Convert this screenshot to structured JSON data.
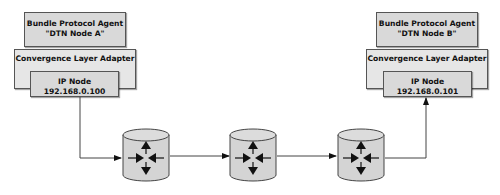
{
  "nodes": {
    "a": {
      "bpa": {
        "line1": "Bundle Protocol Agent",
        "line2": "\"DTN Node A\""
      },
      "cla": {
        "label": "Convergence Layer Adapter"
      },
      "ip": {
        "line1": "IP Node",
        "line2": "192.168.0.100"
      }
    },
    "b": {
      "bpa": {
        "line1": "Bundle Protocol Agent",
        "line2": "\"DTN Node B\""
      },
      "cla": {
        "label": "Convergence Layer Adapter"
      },
      "ip": {
        "line1": "IP Node",
        "line2": "192.168.0.101"
      }
    }
  },
  "routers": [
    {
      "icon": "router-icon"
    },
    {
      "icon": "router-icon"
    },
    {
      "icon": "router-icon"
    }
  ],
  "colors": {
    "box_fill": "#d9d9d9",
    "cla_fill": "#e6e6e6",
    "stroke": "#555555",
    "arrow": "#111111"
  }
}
